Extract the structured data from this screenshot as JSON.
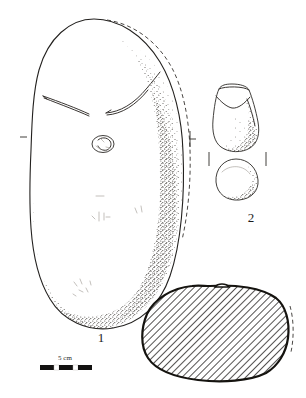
{
  "plate": {
    "title": "Archaeological stone artefact plate",
    "background_color": "#ffffff",
    "ink_color": "#23211f",
    "width_px": 306,
    "height_px": 398
  },
  "figures": [
    {
      "id": "figure-1",
      "label": "1",
      "description": "Large oval ground-stone artefact, face view with stippled shading along right and lower margins, two incised lines forming a shallow V, a small pecked circular depression, and a dashed reconstruction line along the right edge",
      "label_x": 101,
      "label_y": 337
    },
    {
      "id": "figure-2",
      "label": "2",
      "description": "Smaller conical pestle-like artefact shown in two views: upper elevation with V-shaped facet and stippling, lower circular plan/base view",
      "label_x": 251,
      "label_y": 218
    },
    {
      "id": "figure-3",
      "label": "",
      "description": "Hatched transverse cross-section of artefact 1, rounded polygon with diagonal hatching and a dashed edge at right",
      "label_x": 0,
      "label_y": 0
    }
  ],
  "scale": {
    "name": "scale-bar",
    "label": "5 cm",
    "label_x": 63,
    "label_y": 359,
    "segments": 3,
    "bar_x": 40,
    "bar_y": 364,
    "bar_width": 52,
    "bar_height": 5,
    "units": "cm",
    "value": 5
  },
  "colors": {
    "ink": "#23211f",
    "hatch": "#1a1816",
    "stipple": "#4a4642",
    "dashed": "#35322f",
    "paper": "#ffffff"
  }
}
